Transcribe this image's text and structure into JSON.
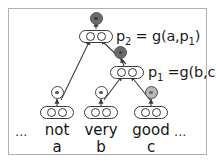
{
  "figure": {
    "border_color": "#b0b0b0",
    "background": "#ffffff"
  },
  "equations": {
    "p2": {
      "lhs": "p",
      "lhs_sub": "2",
      "rhs": " = g(a,p",
      "rhs_sub": "1",
      "rhs_tail": ")"
    },
    "p1": {
      "lhs": "p",
      "lhs_sub": "1",
      "rhs": " =g(b,c)"
    }
  },
  "words": {
    "leading_ellipsis": "...",
    "trailing_ellipsis": "...",
    "items": [
      {
        "text": "not",
        "variable": "a",
        "sentiment": "white"
      },
      {
        "text": "very",
        "variable": "b",
        "sentiment": "white"
      },
      {
        "text": "good",
        "variable": "c",
        "sentiment": "light"
      }
    ]
  },
  "nodes": {
    "p2_sentiment": "dark",
    "p1_sentiment": "dark"
  },
  "vectors": {
    "cells_per_vector": 2
  }
}
